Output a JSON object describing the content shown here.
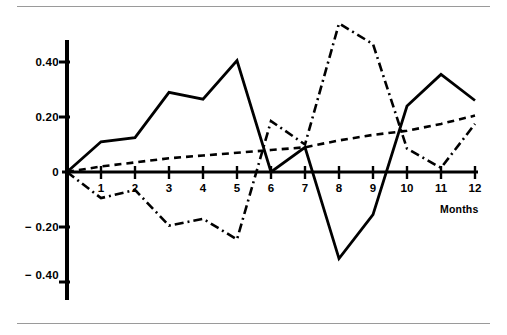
{
  "chart_data": {
    "type": "line",
    "title": "",
    "subtitle": "",
    "xlabel": "Months",
    "ylabel": "",
    "x": [
      0,
      1,
      2,
      3,
      4,
      5,
      6,
      7,
      8,
      9,
      10,
      11,
      12
    ],
    "categories": [
      "0",
      "1",
      "2",
      "3",
      "4",
      "5",
      "6",
      "7",
      "8",
      "9",
      "10",
      "11",
      "12"
    ],
    "xlim": [
      0,
      12
    ],
    "ylim": [
      -0.47,
      0.55
    ],
    "grid": false,
    "legend_position": "none",
    "y_ticks": [
      0.4,
      0.2,
      0,
      -0.2,
      -0.4
    ],
    "y_tick_labels": [
      "0.40",
      "0.20",
      "0",
      "− 0.20",
      "− 0.40"
    ],
    "x_ticks": [
      1,
      2,
      3,
      4,
      5,
      6,
      7,
      8,
      9,
      10,
      11,
      12
    ],
    "x_tick_labels": [
      "1",
      "2",
      "3",
      "4",
      "5",
      "6",
      "7",
      "8",
      "9",
      "10",
      "11",
      "12"
    ],
    "series": [
      {
        "name": "series-solid",
        "style": "solid",
        "color": "#000000",
        "values": [
          0.0,
          0.11,
          0.125,
          0.29,
          0.265,
          0.405,
          0.0,
          0.09,
          -0.315,
          -0.155,
          0.24,
          0.355,
          0.26
        ]
      },
      {
        "name": "series-dashed-trend",
        "style": "dashed",
        "color": "#000000",
        "values": [
          0.0,
          0.02,
          0.035,
          0.05,
          0.06,
          0.07,
          0.08,
          0.09,
          0.115,
          0.135,
          0.15,
          0.175,
          0.205
        ]
      },
      {
        "name": "series-dash-dot",
        "style": "dash-dot",
        "color": "#000000",
        "values": [
          0.0,
          -0.095,
          -0.065,
          -0.195,
          -0.17,
          -0.245,
          0.185,
          0.1,
          0.54,
          0.465,
          0.085,
          0.015,
          0.175
        ]
      }
    ]
  },
  "axis_title": {
    "x": "Months"
  }
}
